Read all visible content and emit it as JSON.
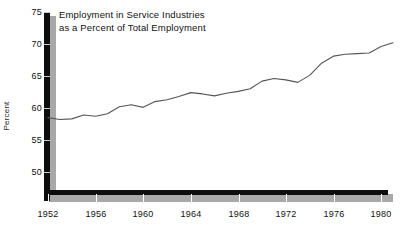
{
  "chart_data": {
    "type": "line",
    "title": "Employment in Service Industries\nas a Percent of Total Employment",
    "xlabel": "",
    "ylabel": "Percent",
    "ylim": [
      48,
      75
    ],
    "xlim": [
      1952,
      1981
    ],
    "grid": false,
    "legend": null,
    "yticks": [
      50,
      55,
      60,
      65,
      70,
      75
    ],
    "xticks": [
      1952,
      1956,
      1960,
      1964,
      1968,
      1972,
      1976,
      1980
    ],
    "line_color": "#555555",
    "axis_color": "#0d0d0d",
    "axis_shadow_color": "#a8a8a8",
    "x": [
      1952,
      1953,
      1954,
      1955,
      1956,
      1957,
      1958,
      1959,
      1960,
      1961,
      1962,
      1963,
      1964,
      1965,
      1966,
      1967,
      1968,
      1969,
      1970,
      1971,
      1972,
      1973,
      1974,
      1975,
      1976,
      1977,
      1978,
      1979,
      1980,
      1981
    ],
    "values": [
      58.5,
      58.2,
      58.3,
      58.9,
      58.7,
      59.1,
      60.2,
      60.5,
      60.1,
      61.0,
      61.3,
      61.8,
      62.4,
      62.2,
      61.9,
      62.3,
      62.6,
      63.0,
      64.2,
      64.6,
      64.4,
      64.0,
      65.1,
      67.0,
      68.1,
      68.4,
      68.5,
      68.6,
      69.6,
      70.2
    ]
  },
  "ticks": {
    "y": [
      "75",
      "70",
      "65",
      "60",
      "55",
      "50"
    ],
    "x": [
      "1952",
      "1956",
      "1960",
      "1964",
      "1968",
      "1972",
      "1976",
      "1980"
    ]
  }
}
